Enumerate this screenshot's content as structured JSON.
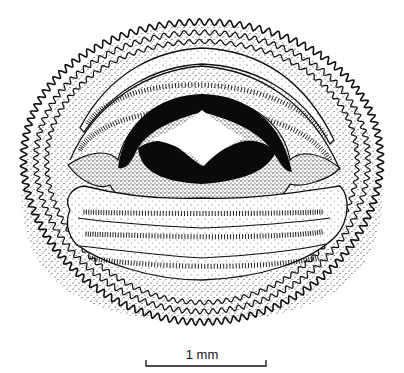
{
  "figure": {
    "style": "black ink stipple line drawing",
    "colors": {
      "ink": "#111111",
      "background": "#ffffff"
    },
    "parts": [
      "marginal-papillae",
      "submarginal-papillae",
      "upper-tooth-rows",
      "upper-jaw-sheath",
      "lower-jaw-sheath",
      "lower-tooth-rows"
    ],
    "upper_tooth_rows": 2,
    "lower_tooth_rows": 3
  },
  "scale_bar": {
    "label": "1 mm"
  }
}
